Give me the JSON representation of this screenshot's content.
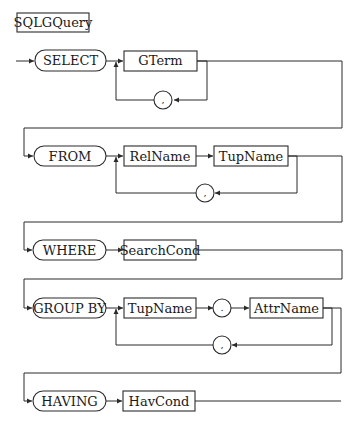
{
  "diagram": {
    "title": "SQLGQuery",
    "type": "syntax-railroad-diagram",
    "colors": {
      "line": "#2a2a2a",
      "text": "#1a1a1a",
      "background": "#ffffff"
    },
    "rows": [
      {
        "keyword": "SELECT",
        "items": [
          "GTerm"
        ],
        "repeat_separator": ","
      },
      {
        "keyword": "FROM",
        "items": [
          "RelName",
          "TupName"
        ],
        "repeat_separator": ","
      },
      {
        "keyword": "WHERE",
        "items": [
          "SearchCond"
        ],
        "repeat_separator": null
      },
      {
        "keyword": "GROUP BY",
        "items": [
          "TupName",
          ".",
          "AttrName"
        ],
        "repeat_separator": ","
      },
      {
        "keyword": "HAVING",
        "items": [
          "HavCond"
        ],
        "repeat_separator": null
      }
    ]
  }
}
